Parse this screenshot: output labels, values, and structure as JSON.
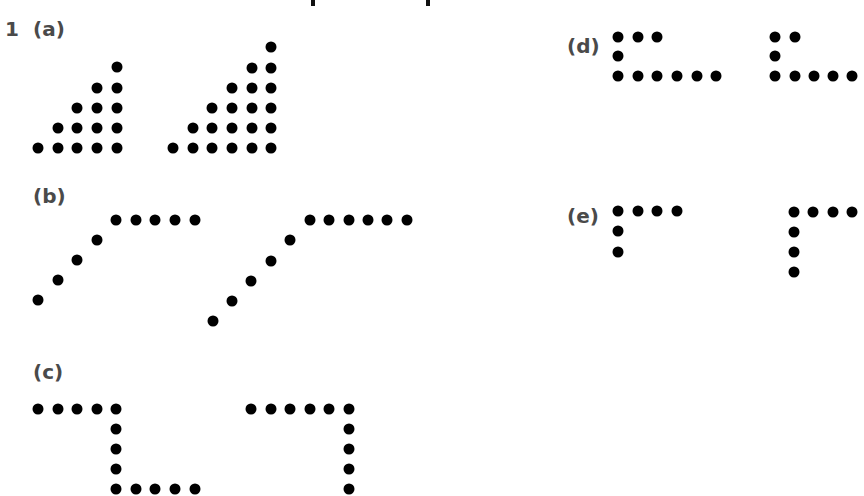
{
  "question_number": "1",
  "parts": [
    {
      "id": "a",
      "label": "(a)",
      "label_pos": [
        33,
        19
      ],
      "patterns": [
        {
          "name": "pattern-a-1",
          "description": "staircase of 15 dots (rows 1-5)",
          "dots": [
            [
              117,
              67
            ],
            [
              97,
              88
            ],
            [
              117,
              88
            ],
            [
              77,
              108
            ],
            [
              97,
              108
            ],
            [
              117,
              108
            ],
            [
              58,
              128
            ],
            [
              77,
              128
            ],
            [
              97,
              128
            ],
            [
              117,
              128
            ],
            [
              38,
              148
            ],
            [
              58,
              148
            ],
            [
              77,
              148
            ],
            [
              97,
              148
            ],
            [
              117,
              148
            ]
          ]
        },
        {
          "name": "pattern-a-2",
          "description": "staircase of 21 dots (rows 1-6)",
          "dots": [
            [
              271,
              47
            ],
            [
              252,
              68
            ],
            [
              271,
              68
            ],
            [
              232,
              88
            ],
            [
              252,
              88
            ],
            [
              271,
              88
            ],
            [
              212,
              108
            ],
            [
              232,
              108
            ],
            [
              252,
              108
            ],
            [
              271,
              108
            ],
            [
              193,
              128
            ],
            [
              212,
              128
            ],
            [
              232,
              128
            ],
            [
              252,
              128
            ],
            [
              271,
              128
            ],
            [
              173,
              148
            ],
            [
              193,
              148
            ],
            [
              212,
              148
            ],
            [
              232,
              148
            ],
            [
              252,
              148
            ],
            [
              271,
              148
            ]
          ]
        }
      ]
    },
    {
      "id": "b",
      "label": "(b)",
      "label_pos": [
        33,
        186
      ],
      "patterns": [
        {
          "name": "pattern-b-1",
          "description": "4 diagonal dots then 5 horizontal",
          "dots": [
            [
              38,
              300
            ],
            [
              58,
              280
            ],
            [
              77,
              260
            ],
            [
              97,
              240
            ],
            [
              116,
              220
            ],
            [
              136,
              220
            ],
            [
              155,
              220
            ],
            [
              175,
              220
            ],
            [
              195,
              220
            ]
          ]
        },
        {
          "name": "pattern-b-2",
          "description": "5 diagonal dots then 6 horizontal",
          "dots": [
            [
              213,
              321
            ],
            [
              232,
              301
            ],
            [
              251,
              281
            ],
            [
              271,
              261
            ],
            [
              290,
              240
            ],
            [
              310,
              220
            ],
            [
              329,
              220
            ],
            [
              349,
              220
            ],
            [
              368,
              220
            ],
            [
              387,
              220
            ],
            [
              407,
              220
            ]
          ]
        }
      ]
    },
    {
      "id": "c",
      "label": "(c)",
      "label_pos": [
        33,
        362
      ],
      "patterns": [
        {
          "name": "pattern-c-1",
          "description": "Z-shape: 5 top, 3 vertical, 5 bottom",
          "dots": [
            [
              38,
              409
            ],
            [
              58,
              409
            ],
            [
              77,
              409
            ],
            [
              97,
              409
            ],
            [
              116,
              409
            ],
            [
              116,
              429
            ],
            [
              116,
              449
            ],
            [
              116,
              469
            ],
            [
              116,
              489
            ],
            [
              136,
              489
            ],
            [
              155,
              489
            ],
            [
              175,
              489
            ],
            [
              195,
              489
            ]
          ]
        },
        {
          "name": "pattern-c-2",
          "description": "Z-shape: 6 top, vertical continues off-image",
          "dots": [
            [
              251,
              409
            ],
            [
              271,
              409
            ],
            [
              290,
              409
            ],
            [
              310,
              409
            ],
            [
              329,
              409
            ],
            [
              349,
              409
            ],
            [
              349,
              429
            ],
            [
              349,
              449
            ],
            [
              349,
              469
            ],
            [
              349,
              489
            ]
          ]
        }
      ]
    },
    {
      "id": "d",
      "label": "(d)",
      "label_pos": [
        567,
        36
      ],
      "patterns": [
        {
          "name": "pattern-d-1",
          "description": "3 top, 1 middle, 6 bottom",
          "dots": [
            [
              618,
              37
            ],
            [
              638,
              37
            ],
            [
              657,
              37
            ],
            [
              618,
              56
            ],
            [
              618,
              76
            ],
            [
              638,
              76
            ],
            [
              657,
              76
            ],
            [
              677,
              76
            ],
            [
              697,
              76
            ],
            [
              716,
              76
            ]
          ]
        },
        {
          "name": "pattern-d-2",
          "description": "2 top, 1 middle, 5 bottom",
          "dots": [
            [
              775,
              37
            ],
            [
              795,
              37
            ],
            [
              775,
              56
            ],
            [
              775,
              76
            ],
            [
              795,
              76
            ],
            [
              814,
              76
            ],
            [
              833,
              76
            ],
            [
              852,
              76
            ]
          ]
        }
      ]
    },
    {
      "id": "e",
      "label": "(e)",
      "label_pos": [
        567,
        206
      ],
      "patterns": [
        {
          "name": "pattern-e-1",
          "description": "4 top, 2 below",
          "dots": [
            [
              618,
              211
            ],
            [
              638,
              211
            ],
            [
              657,
              211
            ],
            [
              677,
              211
            ],
            [
              618,
              231
            ],
            [
              618,
              252
            ]
          ]
        },
        {
          "name": "pattern-e-2",
          "description": "4 top, 3 below",
          "dots": [
            [
              794,
              212
            ],
            [
              813,
              212
            ],
            [
              833,
              212
            ],
            [
              852,
              212
            ],
            [
              794,
              232
            ],
            [
              794,
              252
            ],
            [
              794,
              272
            ]
          ]
        }
      ]
    }
  ],
  "clipped_heading_marks": [
    313,
    428
  ]
}
